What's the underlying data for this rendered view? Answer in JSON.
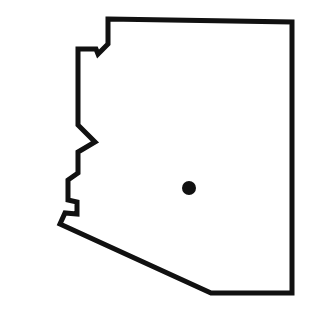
{
  "map": {
    "region": "Arizona state outline",
    "outline_color": "#111111",
    "background_color": "#ffffff",
    "marker": {
      "type": "dot",
      "color": "#111111",
      "x": 189,
      "y": 188,
      "r": 7
    }
  }
}
